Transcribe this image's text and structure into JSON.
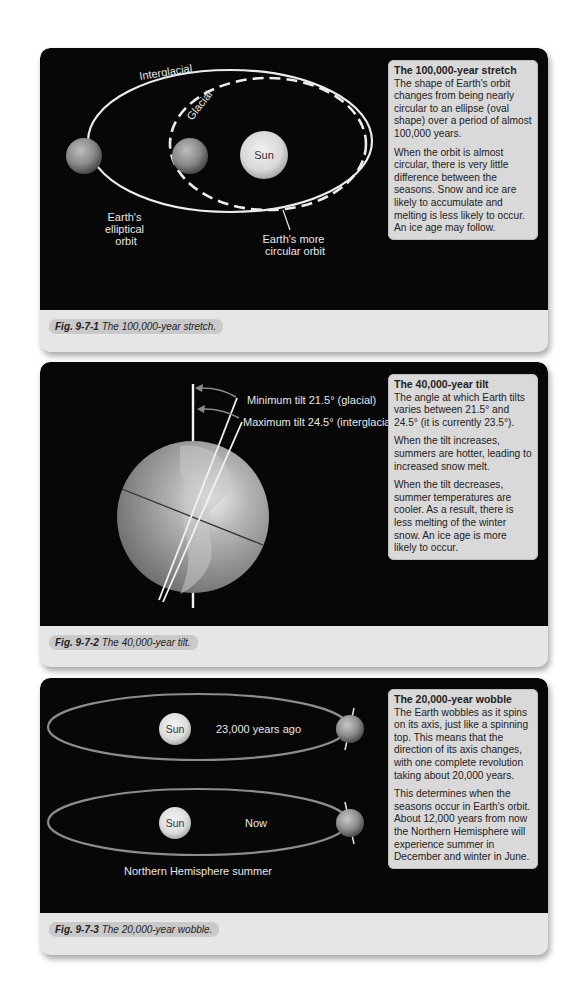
{
  "panels": [
    {
      "id": "stretch",
      "info": {
        "title": "The 100,000-year stretch",
        "paragraphs": [
          "The shape of Earth's orbit changes from being nearly circular to an ellipse (oval shape) over a period of almost 100,000 years.",
          "When the orbit is almost circular, there is very little difference between the seasons. Snow and ice are likely to accumulate and melting is less likely to occur. An ice age may follow."
        ]
      },
      "labels": {
        "interglacial": "Interglacial",
        "glacial": "Glacial",
        "sun": "Sun",
        "elliptical_orbit": [
          "Earth's",
          "elliptical",
          "orbit"
        ],
        "circular_orbit": [
          "Earth's more",
          "circular orbit"
        ]
      },
      "caption": {
        "fig": "Fig. 9-7-1",
        "text": "The 100,000-year stretch."
      }
    },
    {
      "id": "tilt",
      "info": {
        "title": "The 40,000-year tilt",
        "paragraphs": [
          "The angle at which Earth tilts varies between 21.5° and 24.5° (it is currently 23.5°).",
          "When the tilt increases, summers are hotter, leading to increased snow melt.",
          "When the tilt decreases, summer temperatures are cooler. As a result, there is less melting of the winter snow. An ice age is more likely to occur."
        ]
      },
      "labels": {
        "min_tilt": "Minimum tilt 21.5° (glacial)",
        "max_tilt": "Maximum tilt 24.5° (interglacial)"
      },
      "caption": {
        "fig": "Fig. 9-7-2",
        "text": "The 40,000-year tilt."
      }
    },
    {
      "id": "wobble",
      "info": {
        "title": "The 20,000-year wobble",
        "paragraphs": [
          "The Earth wobbles as it spins on its axis, just like a spinning top. This means that the direction of its axis changes, with one complete revolution taking about 20,000 years.",
          "This determines when the seasons occur in Earth's orbit. About 12,000 years from now the Northern Hemisphere will experience summer in December and winter in June."
        ]
      },
      "labels": {
        "sun_top": "Sun",
        "past": "23,000 years ago",
        "sun_bottom": "Sun",
        "now": "Now",
        "nh_summer": "Northern Hemisphere summer"
      },
      "caption": {
        "fig": "Fig. 9-7-3",
        "text": "The 20,000-year wobble."
      }
    }
  ]
}
